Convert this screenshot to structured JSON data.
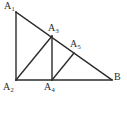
{
  "figure": {
    "type": "geometry-diagram",
    "background_color": "#ffffff",
    "stroke_color": "#2b2b2b",
    "label_color": "#2b2b2b",
    "stroke_width": 1.4,
    "canvas": {
      "width": 127,
      "height": 113
    },
    "points": {
      "A1": {
        "label_base": "A",
        "label_sub": "1",
        "x": 16,
        "y": 12
      },
      "A2": {
        "label_base": "A",
        "label_sub": "2",
        "x": 16,
        "y": 80
      },
      "A3": {
        "label_base": "A",
        "label_sub": "3",
        "x": 52,
        "y": 36
      },
      "A4": {
        "label_base": "A",
        "label_sub": "4",
        "x": 52,
        "y": 80
      },
      "A5": {
        "label_base": "A",
        "label_sub": "5",
        "x": 74,
        "y": 53
      },
      "B": {
        "label_base": "B",
        "label_sub": "",
        "x": 112,
        "y": 80
      }
    },
    "segments": [
      {
        "name": "leg-vertical-a1-a2",
        "x1": 16,
        "y1": 12,
        "x2": 16,
        "y2": 80
      },
      {
        "name": "base-a2-b",
        "x1": 16,
        "y1": 80,
        "x2": 112,
        "y2": 80
      },
      {
        "name": "hypotenuse-a1-b",
        "x1": 16,
        "y1": 12,
        "x2": 112,
        "y2": 80
      },
      {
        "name": "segment-a2-a3",
        "x1": 16,
        "y1": 80,
        "x2": 52,
        "y2": 36
      },
      {
        "name": "segment-a3-a4",
        "x1": 52,
        "y1": 36,
        "x2": 52,
        "y2": 80
      },
      {
        "name": "segment-a4-a5",
        "x1": 52,
        "y1": 80,
        "x2": 74,
        "y2": 53
      }
    ]
  }
}
